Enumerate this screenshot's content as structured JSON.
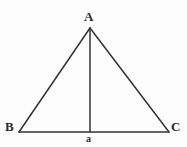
{
  "figure": {
    "kind": "geometry-diagram",
    "background_color": "#fdfdfd",
    "stroke_color": "#333333",
    "stroke_width": 1.5,
    "width": 187,
    "height": 147,
    "points": {
      "apex": {
        "label": "A",
        "x": 90,
        "y": 28
      },
      "bottom_left": {
        "label": "B",
        "x": 19,
        "y": 132
      },
      "bottom_right": {
        "label": "C",
        "x": 169,
        "y": 132
      },
      "base_midpoint": {
        "label": "a",
        "x": 90,
        "y": 132
      }
    },
    "segments": [
      {
        "name": "side-ab",
        "from": "apex",
        "to": "bottom_left"
      },
      {
        "name": "side-ac",
        "from": "apex",
        "to": "bottom_right"
      },
      {
        "name": "base-bc",
        "from": "bottom_left",
        "to": "bottom_right"
      },
      {
        "name": "altitude-aa",
        "from": "apex",
        "to": "base_midpoint"
      }
    ],
    "labels": {
      "apex": "A",
      "bottom_left": "B",
      "bottom_right": "C",
      "base_midpoint": "a"
    }
  }
}
